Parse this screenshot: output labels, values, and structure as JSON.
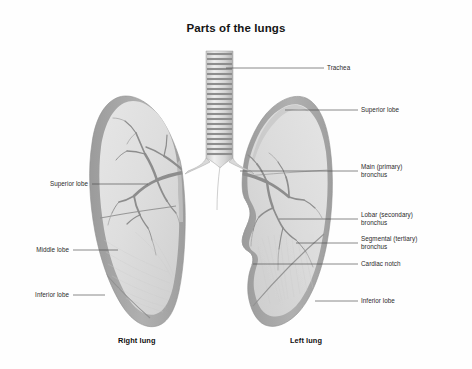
{
  "figure": {
    "title": "Parts of the lungs",
    "background_color": "#ffffff",
    "line_color": "#555555",
    "lung_rim_color": "#a3a3a3",
    "lung_fill_color": "#dcdcdc",
    "bronchi_color": "#9a9a9a",
    "trachea_color": "#b4b4b4"
  },
  "labels": {
    "trachea": "Trachea",
    "superior_lobe_left_lung": "Superior lobe",
    "main_bronchus": "Main (primary)\nbronchus",
    "lobar_bronchus": "Lobar (secondary)\nbronchus",
    "segmental_bronchus": "Segmental (tertiary)\nbronchus",
    "cardiac_notch": "Cardiac notch",
    "inferior_lobe_left_lung": "Inferior lobe",
    "superior_lobe_right_lung": "Superior lobe",
    "middle_lobe_right_lung": "Middle lobe",
    "inferior_lobe_right_lung": "Inferior lobe"
  },
  "captions": {
    "right_lung": "Right lung",
    "left_lung": "Left lung"
  }
}
